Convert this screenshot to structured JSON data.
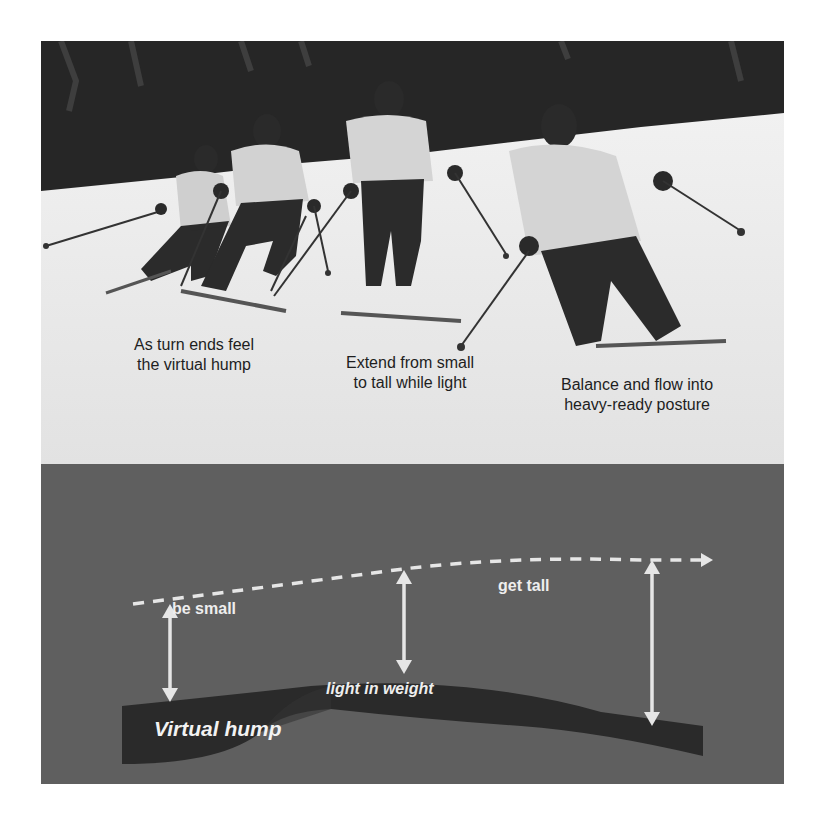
{
  "photo": {
    "description": "Four sequential frames of a skier overlaid across a snowy slope with dark evergreen trees behind",
    "captions": [
      {
        "line1": "As turn ends feel",
        "line2": "the virtual hump"
      },
      {
        "line1": "Extend from small",
        "line2": "to tall while light"
      },
      {
        "line1": "Balance and flow into",
        "line2": "heavy-ready posture"
      }
    ]
  },
  "diagram": {
    "labels": {
      "be_small": "be small",
      "get_tall": "get tall",
      "light_in_weight": "light in weight",
      "virtual_hump": "Virtual hump"
    },
    "colors": {
      "background": "#5f5f5f",
      "hump": "#2a2a2a",
      "arrows": "#e6e6e6",
      "text": "#eeeeee"
    }
  }
}
